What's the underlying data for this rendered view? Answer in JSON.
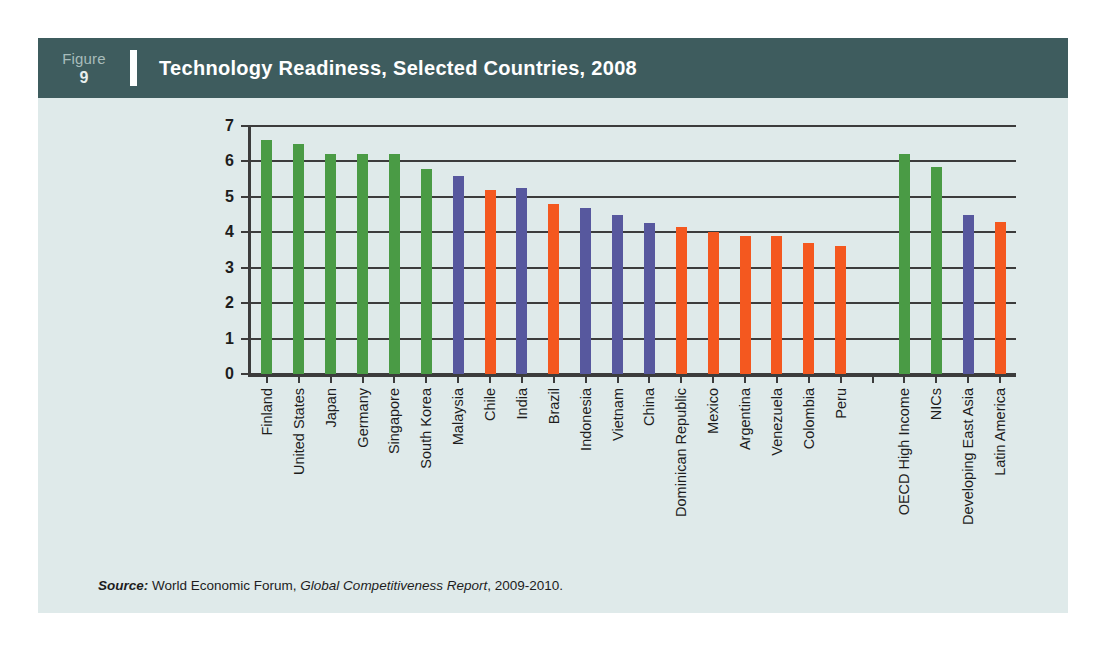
{
  "figure": {
    "label_word": "Figure",
    "number": "9",
    "title": "Technology Readiness, Selected Countries, 2008"
  },
  "source": {
    "label": "Source:",
    "org": "World Economic Forum,",
    "publication": "Global Competitiveness Report",
    "years": ", 2009-2010."
  },
  "colors": {
    "header_band": "#3e5c5e",
    "panel_background": "#dfeaea",
    "green": "#4a9b45",
    "blue": "#57589e",
    "orange": "#f4581f",
    "axis": "#3c3c3c"
  },
  "chart_data": {
    "type": "bar",
    "title": "Technology Readiness, Selected Countries, 2008",
    "xlabel": "",
    "ylabel": "",
    "ylim": [
      0,
      7
    ],
    "yticks": [
      "0",
      "1",
      "2",
      "3",
      "4",
      "5",
      "6",
      "7"
    ],
    "grid": true,
    "legend": "none",
    "categories": [
      "Finland",
      "United States",
      "Japan",
      "Germany",
      "Singapore",
      "South Korea",
      "Malaysia",
      "Chile",
      "India",
      "Brazil",
      "Indonesia",
      "Vietnam",
      "China",
      "Dominican Republic",
      "Mexico",
      "Argentina",
      "Venezuela",
      "Colombia",
      "Peru",
      "",
      "OECD High Income",
      "NICs",
      "Developing East Asia",
      "Latin America"
    ],
    "values": [
      6.6,
      6.5,
      6.2,
      6.2,
      6.2,
      5.8,
      5.6,
      5.2,
      5.25,
      4.8,
      4.7,
      4.5,
      4.25,
      4.15,
      4.0,
      3.9,
      3.9,
      3.7,
      3.6,
      null,
      6.2,
      5.85,
      4.5,
      4.3
    ],
    "bar_colors": [
      "green",
      "green",
      "green",
      "green",
      "green",
      "green",
      "blue",
      "orange",
      "blue",
      "orange",
      "blue",
      "blue",
      "blue",
      "orange",
      "orange",
      "orange",
      "orange",
      "orange",
      "orange",
      null,
      "green",
      "green",
      "blue",
      "orange"
    ]
  }
}
